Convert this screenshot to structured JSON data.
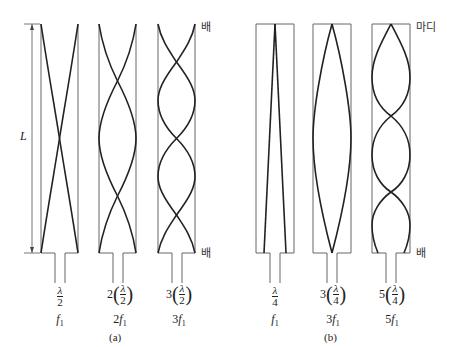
{
  "figure": {
    "length_label": "L",
    "korean_labels": {
      "belly_a_top": "배",
      "belly_a_bottom": "배",
      "node_b_top": "마디",
      "belly_b_bottom": "배"
    },
    "panels": [
      {
        "caption": "(a)",
        "type": "open-open",
        "tubes": [
          {
            "coef": "",
            "frac_num": "λ",
            "frac_den": "2",
            "freq": "f",
            "freq_coef": "",
            "sub": "1"
          },
          {
            "coef": "2",
            "frac_num": "λ",
            "frac_den": "2",
            "freq": "f",
            "freq_coef": "2",
            "sub": "1"
          },
          {
            "coef": "3",
            "frac_num": "λ",
            "frac_den": "2",
            "freq": "f",
            "freq_coef": "3",
            "sub": "1"
          }
        ]
      },
      {
        "caption": "(b)",
        "type": "closed-open",
        "tubes": [
          {
            "coef": "",
            "frac_num": "λ",
            "frac_den": "4",
            "freq": "f",
            "freq_coef": "",
            "sub": "1"
          },
          {
            "coef": "3",
            "frac_num": "λ",
            "frac_den": "4",
            "freq": "f",
            "freq_coef": "3",
            "sub": "1"
          },
          {
            "coef": "5",
            "frac_num": "λ",
            "frac_den": "4",
            "freq": "f",
            "freq_coef": "5",
            "sub": "1"
          }
        ]
      }
    ]
  }
}
